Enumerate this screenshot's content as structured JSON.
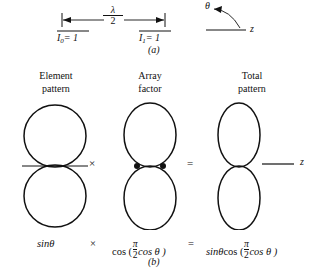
{
  "figure": {
    "caption_a": "(a)",
    "caption_b": "(b)",
    "background": "#ffffff",
    "ink": "#111111"
  },
  "part_a": {
    "spacing_label": {
      "numerator": "λ",
      "denominator": "2"
    },
    "element_left": {
      "current_symbol": "I",
      "index": "0",
      "equals_value": "= 1"
    },
    "element_right": {
      "current_symbol": "I",
      "index": "1",
      "equals_value": "= 1"
    },
    "angle_axis": {
      "theta_label": "θ",
      "z_label": "z"
    }
  },
  "part_b": {
    "columns": [
      {
        "heading_line1": "Element",
        "heading_line2": "pattern",
        "equation": "sinθ",
        "pattern": "figure-eight-circles"
      },
      {
        "heading_line1": "Array",
        "heading_line2": "factor",
        "equation": "cos (π/2 cos θ)",
        "pattern": "figure-eight-ellipses-with-dots"
      },
      {
        "heading_line1": "Total",
        "heading_line2": "pattern",
        "equation": "sinθ cos (π/2 cos θ)",
        "pattern": "figure-eight-narrow"
      }
    ],
    "operators": {
      "multiply": "×",
      "equals": "="
    },
    "equation_parts": {
      "sin_theta": "sinθ",
      "cos_open": "cos (",
      "frac_num": "π",
      "frac_den": "2",
      "cos_theta_close": "cos θ )",
      "total_sin": "sinθ",
      "total_cos_open": "cos (",
      "total_frac_num": "π",
      "total_frac_den": "2",
      "total_cos_theta_close": "cos θ )"
    },
    "z_axis_label": "z"
  }
}
